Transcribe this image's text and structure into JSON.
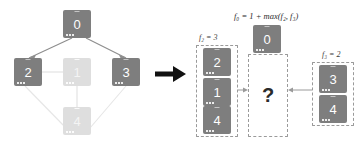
{
  "figure": {
    "title": "",
    "transition_arrow": "right-arrow"
  },
  "graph": {
    "name": "dependency-graph",
    "nodes": [
      {
        "id": "n0",
        "label": "0",
        "state": "active",
        "x": 63,
        "y": 10
      },
      {
        "id": "n2",
        "label": "2",
        "state": "active",
        "x": 14,
        "y": 58
      },
      {
        "id": "n1",
        "label": "1",
        "state": "faded",
        "x": 63,
        "y": 58
      },
      {
        "id": "n3",
        "label": "3",
        "state": "active",
        "x": 112,
        "y": 58
      },
      {
        "id": "n4",
        "label": "4",
        "state": "faded",
        "x": 63,
        "y": 107
      }
    ],
    "edges": [
      {
        "from": "n0",
        "to": "n2",
        "state": "active"
      },
      {
        "from": "n0",
        "to": "n3",
        "state": "active"
      },
      {
        "from": "n2",
        "to": "n1",
        "state": "faded"
      },
      {
        "from": "n1",
        "to": "n4",
        "state": "faded"
      },
      {
        "from": "n2",
        "to": "n4",
        "state": "faded"
      },
      {
        "from": "n3",
        "to": "n4",
        "state": "faded"
      }
    ]
  },
  "recursion": {
    "formula": "f₀ = 1 + max(f₂, f₃)",
    "left_group": {
      "label": "f₂ = 3",
      "items": [
        "2",
        "1",
        "4"
      ]
    },
    "center_group": {
      "header_node": "0",
      "placeholder": "?"
    },
    "right_group": {
      "label": "f₃ = 2",
      "items": [
        "3",
        "4"
      ]
    },
    "connector_left": "arrow-right-thin",
    "connector_right": "arrow-left-thin"
  },
  "colors": {
    "node_active": "#7e7e7e",
    "node_faded": "#dedede",
    "edge_active": "#8d8d8d",
    "edge_faded": "#e2e2e2",
    "dash_border": "#9a9a9a",
    "arrow": "#111111",
    "text": "#2b2b2b",
    "background": "#ffffff"
  }
}
